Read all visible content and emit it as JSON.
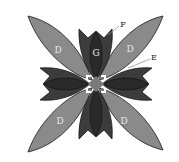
{
  "diagram": {
    "labels": {
      "D_top_left": "D",
      "D_top_right": "D",
      "D_bottom_left": "D",
      "D_bottom_right": "D",
      "G": "G",
      "F": "F",
      "E": "E"
    },
    "colors": {
      "leaf_D": "#8a8a8a",
      "tulip_outer": "#3c3c3c",
      "tulip_inner": "#2a2a2a",
      "center": "#7a7a7a",
      "outline": "#1a1a1a",
      "label_light": "#e8e8e8",
      "label_dark": "#222222"
    }
  }
}
